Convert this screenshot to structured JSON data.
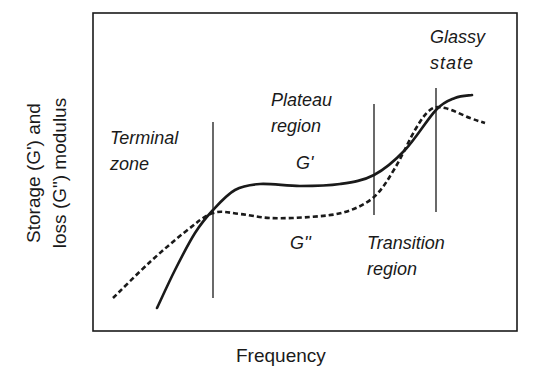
{
  "chart_data": {
    "type": "line",
    "title": "",
    "xlabel": "Frequency",
    "ylabel_line1": "Storage (G') and",
    "ylabel_line2": "loss (G\") modulus",
    "axes": {
      "ticks": false,
      "grid": false,
      "frame": true
    },
    "regions": [
      {
        "name": "Terminal zone",
        "line1": "Terminal",
        "line2": "zone"
      },
      {
        "name": "Plateau region",
        "line1": "Plateau",
        "line2": "region"
      },
      {
        "name": "Transition region",
        "line1": "Transition",
        "line2": "region"
      },
      {
        "name": "Glassy state",
        "line1": "Glassy",
        "line2": "state"
      }
    ],
    "boundaries_x_px": [
      213,
      374,
      436
    ],
    "series": [
      {
        "name": "G'",
        "label": "G'",
        "style": "solid",
        "points_px": [
          [
            157,
            308
          ],
          [
            175,
            270
          ],
          [
            195,
            233
          ],
          [
            213,
            210
          ],
          [
            235,
            190
          ],
          [
            260,
            184
          ],
          [
            300,
            186
          ],
          [
            340,
            184
          ],
          [
            374,
            175
          ],
          [
            405,
            150
          ],
          [
            436,
            110
          ],
          [
            455,
            98
          ],
          [
            472,
            95
          ]
        ]
      },
      {
        "name": "G\"",
        "label": "G''",
        "style": "dashed",
        "points_px": [
          [
            113,
            298
          ],
          [
            150,
            262
          ],
          [
            185,
            232
          ],
          [
            213,
            213
          ],
          [
            240,
            214
          ],
          [
            270,
            218
          ],
          [
            310,
            217
          ],
          [
            345,
            212
          ],
          [
            374,
            197
          ],
          [
            395,
            168
          ],
          [
            415,
            130
          ],
          [
            430,
            110
          ],
          [
            445,
            108
          ],
          [
            470,
            118
          ],
          [
            485,
            123
          ]
        ]
      }
    ]
  },
  "labels": {
    "terminal_1": "Terminal",
    "terminal_2": "zone",
    "plateau_1": "Plateau",
    "plateau_2": "region",
    "glassy_1": "Glassy",
    "glassy_2": "state",
    "transition_1": "Transition",
    "transition_2": "region",
    "g_prime": "G'",
    "g_double_prime": "G''",
    "xlabel": "Frequency",
    "ylabel_1": "Storage (G') and",
    "ylabel_2": "loss (G\") modulus"
  },
  "colors": {
    "ink": "#1a1a1a",
    "background": "#ffffff"
  }
}
